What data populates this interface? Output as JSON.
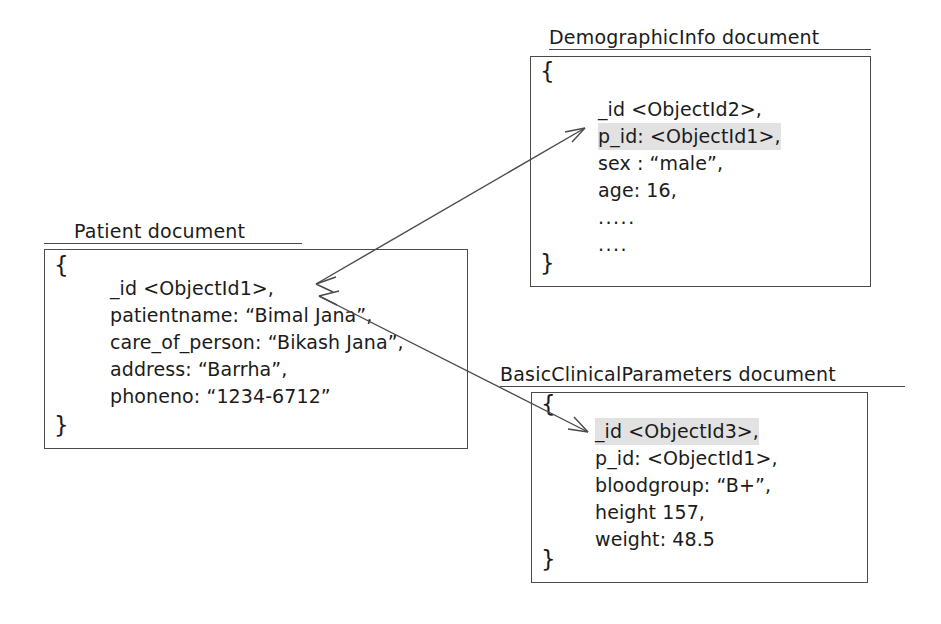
{
  "diagram": {
    "line_color": "#4a4a4a",
    "highlight_color": "#e2e2e2",
    "text_color": "#1b1b1b"
  },
  "patient_doc": {
    "title": "Patient document",
    "open_brace": "{",
    "close_brace": "}",
    "lines": [
      {
        "text": "_id <ObjectId1>,",
        "highlight": false
      },
      {
        "text": "patientname:  “Bimal Jana”,",
        "highlight": false
      },
      {
        "text": "care_of_person: “Bikash Jana”,",
        "highlight": false
      },
      {
        "text": "address: “Barrha”,",
        "highlight": false
      },
      {
        "text": "phoneno: “1234-6712”",
        "highlight": false
      }
    ]
  },
  "demographic_doc": {
    "title": "DemographicInfo document",
    "open_brace": "{",
    "close_brace": "}",
    "lines": [
      {
        "text": "_id <ObjectId2>,",
        "highlight": false
      },
      {
        "text": "p_id:  <ObjectId1>,",
        "highlight": true
      },
      {
        "text": "sex : “male”,",
        "highlight": false
      },
      {
        "text": "age: 16,",
        "highlight": false
      },
      {
        "text": ".....",
        "highlight": false
      },
      {
        "text": "....",
        "highlight": false
      }
    ]
  },
  "clinical_doc": {
    "title": "BasicClinicalParameters document",
    "open_brace": "{",
    "close_brace": "}",
    "lines": [
      {
        "text": "_id <ObjectId3>,",
        "highlight": true
      },
      {
        "text": "p_id:  <ObjectId1>,",
        "highlight": false
      },
      {
        "text": "bloodgroup: “B+”,",
        "highlight": false
      },
      {
        "text": "height 157,",
        "highlight": false
      },
      {
        "text": "weight: 48.5",
        "highlight": false
      }
    ]
  },
  "connectors": [
    {
      "name": "patient-to-demographic",
      "from": "patient_doc._id",
      "to": "demographic_doc.p_id",
      "double_headed": true
    },
    {
      "name": "patient-to-clinical",
      "from": "patient_doc._id",
      "to": "clinical_doc._id",
      "double_headed": true
    }
  ]
}
